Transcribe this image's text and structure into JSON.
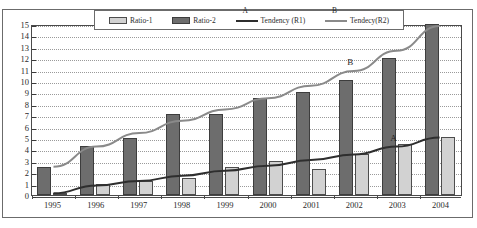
{
  "chart_data": {
    "type": "bar",
    "title": "",
    "xlabel": "",
    "ylabel": "",
    "ylim": [
      0,
      15
    ],
    "ytick_step": 1,
    "grid": true,
    "legend_position": "top-center",
    "categories": [
      "1995",
      "1996",
      "1997",
      "1998",
      "1999",
      "2000",
      "2001",
      "2002",
      "2003",
      "2004"
    ],
    "yticks": [
      "0",
      "1",
      "2",
      "3",
      "4",
      "5",
      "6",
      "7",
      "8",
      "9",
      "10",
      "11",
      "12",
      "13",
      "14",
      "15"
    ],
    "series": [
      {
        "name": "Ratio-2",
        "kind": "bar",
        "color": "#6d6d6d",
        "values": [
          2.5,
          4.3,
          5.0,
          7.1,
          7.1,
          8.5,
          9.0,
          10.1,
          12.0,
          15.0
        ]
      },
      {
        "name": "Ratio-1",
        "kind": "bar",
        "color": "#d2d2d2",
        "values": [
          0.2,
          1.0,
          1.2,
          1.5,
          2.5,
          3.0,
          2.3,
          3.6,
          4.5,
          5.1
        ]
      },
      {
        "name": "Tendency (R1)",
        "kind": "line",
        "tag": "A",
        "color": "#2e2e2e",
        "values": [
          0.15,
          0.85,
          1.25,
          1.7,
          2.15,
          2.6,
          3.1,
          3.6,
          4.3,
          5.1
        ]
      },
      {
        "name": "Tendecy(R2)",
        "kind": "line",
        "tag": "B",
        "color": "#8a8a8a",
        "values": [
          2.5,
          4.3,
          5.5,
          6.6,
          7.6,
          8.6,
          9.7,
          11.0,
          12.8,
          15.0
        ]
      }
    ],
    "annotations": [
      {
        "text": "A",
        "series": "Tendency (R1)",
        "at_category": "2003"
      },
      {
        "text": "B",
        "series": "Tendecy(R2)",
        "at_category": "2002"
      }
    ]
  },
  "legend": {
    "items": [
      {
        "label": "Ratio-1",
        "kind": "swatch",
        "swatch": "ratio1",
        "tag": ""
      },
      {
        "label": "Ratio-2",
        "kind": "swatch",
        "swatch": "ratio2",
        "tag": ""
      },
      {
        "label": "Tendency (R1)",
        "kind": "line",
        "swatch": "r1",
        "tag": "A"
      },
      {
        "label": "Tendecy(R2)",
        "kind": "line",
        "swatch": "r2",
        "tag": "B"
      }
    ]
  }
}
